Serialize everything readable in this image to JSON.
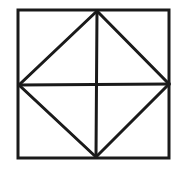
{
  "figure": {
    "stroke_color": "#1a1a1a",
    "background_color": "#ffffff",
    "stroke_width": 3
  },
  "geometry": {
    "outer_square": {
      "x1": 18,
      "y1": 10,
      "x2": 169,
      "y2": 158
    },
    "diamond": {
      "top": [
        97,
        11
      ],
      "right": [
        169,
        84
      ],
      "bottom": [
        96,
        157
      ],
      "left": [
        19,
        85
      ]
    },
    "vertical_midline": {
      "x1": 97,
      "y1": 11,
      "x2": 96,
      "y2": 157
    },
    "horizontal_midline": {
      "x1": 19,
      "y1": 85,
      "x2": 169,
      "y2": 84
    }
  }
}
